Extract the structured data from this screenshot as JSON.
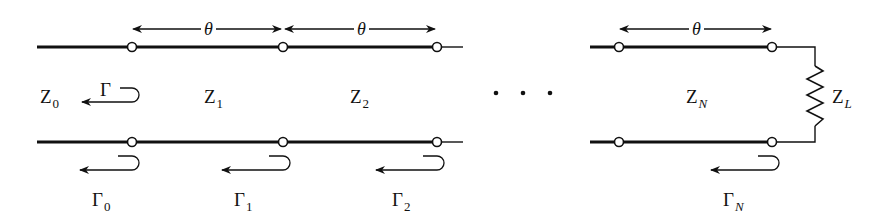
{
  "diagram": {
    "colors": {
      "line": "#111111",
      "node_fill": "#ffffff",
      "background": "#ffffff"
    },
    "sections": [
      {
        "id": "Z0",
        "impedance": {
          "base": "Z",
          "sub": "0"
        }
      },
      {
        "id": "Z1",
        "impedance": {
          "base": "Z",
          "sub": "1"
        },
        "length": "θ"
      },
      {
        "id": "Z2",
        "impedance": {
          "base": "Z",
          "sub": "2"
        },
        "length": "θ"
      },
      {
        "id": "ZN",
        "impedance": {
          "base": "Z",
          "sub": "N"
        },
        "length": "θ"
      }
    ],
    "load": {
      "base": "Z",
      "sub": "L"
    },
    "overall_reflection": {
      "base": "Γ",
      "sub": ""
    },
    "reflections": [
      {
        "base": "Γ",
        "sub": "0"
      },
      {
        "base": "Γ",
        "sub": "1"
      },
      {
        "base": "Γ",
        "sub": "2"
      },
      {
        "base": "Γ",
        "sub": "N"
      }
    ],
    "ellipsis": "· · ·",
    "theta_label": "θ"
  }
}
